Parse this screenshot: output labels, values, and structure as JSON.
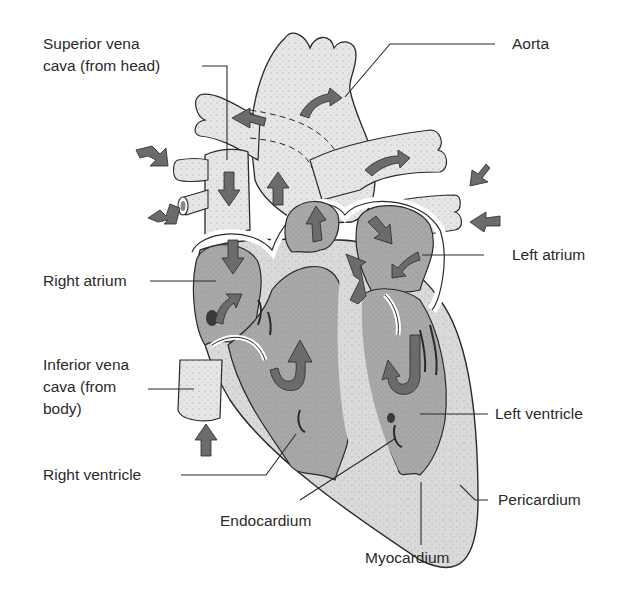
{
  "diagram": {
    "colors": {
      "background": "#ffffff",
      "vessel_fill": "#e4e4e4",
      "chamber_fill": "#a9a9a9",
      "muscle_fill": "#d6d6d6",
      "arrow_fill": "#6b6b6b",
      "outline": "#2a2a2a",
      "label_text": "#2a2a2a"
    },
    "labels": {
      "superior_vena_cava": {
        "line1": "Superior vena",
        "line2": "cava (from head)"
      },
      "aorta": "Aorta",
      "left_atrium": "Left atrium",
      "right_atrium": "Right atrium",
      "inferior_vena_cava": {
        "line1": "Inferior vena",
        "line2": "cava (from",
        "line3": "body)"
      },
      "left_ventricle": "Left ventricle",
      "right_ventricle": "Right ventricle",
      "endocardium": "Endocardium",
      "pericardium": "Pericardium",
      "myocardium": "Myocardium"
    },
    "arrows": {
      "icon": "blood-flow-arrow-icon",
      "count": 20
    }
  }
}
